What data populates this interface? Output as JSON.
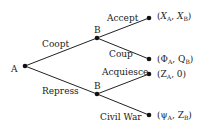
{
  "diagram": {
    "type": "game-tree",
    "nodes": {
      "root": {
        "label": "A"
      },
      "b_upper": {
        "label": "B"
      },
      "b_lower": {
        "label": "B"
      }
    },
    "edges": {
      "coopt": "Coopt",
      "repress": "Repress",
      "accept": "Accept",
      "coup": "Coup",
      "acquiesce": "Acquiesce",
      "civil_war": "Civil War"
    },
    "payoffs": [
      {
        "a_main": "X",
        "a_sub": "A",
        "b_main": "X",
        "b_sub": "B",
        "text": "(X_A, X_B)"
      },
      {
        "a_main": "Φ",
        "a_sub": "A",
        "b_main": "Q",
        "b_sub": "B",
        "text": "(Φ_A, Q_B)"
      },
      {
        "a_main": "Z",
        "a_sub": "A",
        "b_main": "0",
        "b_sub": "",
        "text": "(Z_A, 0)"
      },
      {
        "a_main": "ψ",
        "a_sub": "A",
        "b_main": "Z",
        "b_sub": "B",
        "text": "(ψ_A, Z_B)"
      }
    ],
    "punct": {
      "open": "(",
      "comma": ", ",
      "close": ")"
    }
  }
}
